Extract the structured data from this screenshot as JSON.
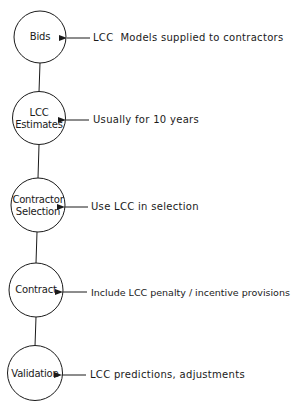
{
  "diagram": {
    "type": "vertical-process-flow",
    "colors": {
      "stroke": "#1a1a1a",
      "background": "#ffffff",
      "text": "#1a1a1a"
    },
    "nodes": [
      {
        "id": "bids",
        "line1": "Bids",
        "line2": "",
        "note": "LCC  Models supplied to contractors"
      },
      {
        "id": "lcc-estimates",
        "line1": "LCC",
        "line2": "Estimates",
        "note": "Usually for 10 years"
      },
      {
        "id": "contractor-selection",
        "line1": "Contractor",
        "line2": "Selection",
        "note": "Use LCC in selection"
      },
      {
        "id": "contract",
        "line1": "Contract",
        "line2": "",
        "note": "Include LCC penalty / incentive provisions"
      },
      {
        "id": "validation",
        "line1": "Validation",
        "line2": "",
        "note": "LCC predictions, adjustments"
      }
    ]
  }
}
